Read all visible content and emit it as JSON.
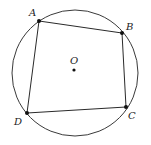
{
  "diagram": {
    "circle": {
      "cx": 75,
      "cy": 73,
      "r": 63,
      "stroke": "#3a3a3a"
    },
    "center": {
      "label": "O",
      "x": 74,
      "y": 70,
      "label_x": 70,
      "label_y": 64
    },
    "vertices": [
      {
        "label": "A",
        "x": 39,
        "y": 21,
        "label_x": 29,
        "label_y": 16
      },
      {
        "label": "B",
        "x": 122,
        "y": 33,
        "label_x": 126,
        "label_y": 30
      },
      {
        "label": "C",
        "x": 126,
        "y": 107,
        "label_x": 128,
        "label_y": 119
      },
      {
        "label": "D",
        "x": 27,
        "y": 113,
        "label_x": 14,
        "label_y": 125
      }
    ],
    "edges": [
      {
        "from": "A",
        "to": "B"
      },
      {
        "from": "B",
        "to": "C"
      },
      {
        "from": "C",
        "to": "D"
      },
      {
        "from": "D",
        "to": "A"
      }
    ]
  }
}
